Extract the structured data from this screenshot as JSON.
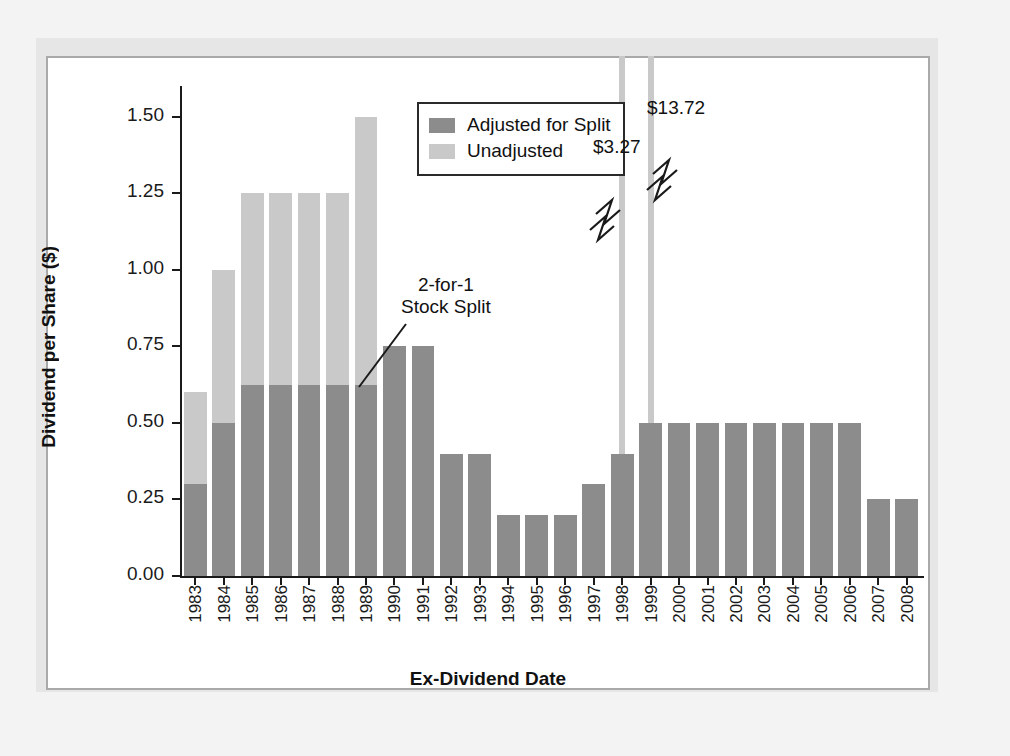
{
  "chart_data": {
    "type": "bar",
    "title": "",
    "xlabel": "Ex-Dividend Date",
    "ylabel": "Dividend per Share ($)",
    "ylim": [
      0.0,
      1.6
    ],
    "ytick_labels": [
      "0.00",
      "0.25",
      "0.50",
      "0.75",
      "1.00",
      "1.25",
      "1.50"
    ],
    "ytick_values": [
      0.0,
      0.25,
      0.5,
      0.75,
      1.0,
      1.25,
      1.5
    ],
    "grid": false,
    "legend_position": "top-center",
    "categories": [
      "1983",
      "1984",
      "1985",
      "1986",
      "1987",
      "1988",
      "1989",
      "1990",
      "1991",
      "1992",
      "1993",
      "1994",
      "1995",
      "1996",
      "1997",
      "1998",
      "1999",
      "2000",
      "2001",
      "2002",
      "2003",
      "2004",
      "2005",
      "2006",
      "2007",
      "2008"
    ],
    "series": [
      {
        "name": "Adjusted for Split",
        "color": "#8c8c8c",
        "values": [
          0.3,
          0.5,
          0.625,
          0.625,
          0.625,
          0.625,
          0.625,
          0.75,
          0.75,
          0.4,
          0.4,
          0.2,
          0.2,
          0.2,
          0.3,
          0.4,
          0.5,
          0.5,
          0.5,
          0.5,
          0.5,
          0.5,
          0.5,
          0.5,
          0.25,
          0.25
        ]
      },
      {
        "name": "Unadjusted",
        "color": "#c9c9c9",
        "values": [
          0.6,
          1.0,
          1.25,
          1.25,
          1.25,
          1.25,
          1.5,
          null,
          null,
          null,
          null,
          null,
          null,
          null,
          null,
          3.27,
          13.72,
          null,
          null,
          null,
          null,
          null,
          null,
          null,
          null,
          null
        ]
      }
    ],
    "annotations": [
      {
        "name": "stock-split",
        "text_lines": [
          "2-for-1",
          "Stock Split"
        ],
        "points_to_category": "1990"
      },
      {
        "name": "break-value-1998",
        "text": "$3.27",
        "category": "1998"
      },
      {
        "name": "break-value-1999",
        "text": "$13.72",
        "category": "1999"
      }
    ]
  },
  "legend": {
    "items": [
      {
        "label": "Adjusted for Split",
        "color": "#8c8c8c"
      },
      {
        "label": "Unadjusted",
        "color": "#c9c9c9"
      }
    ]
  },
  "axes": {
    "y_title": "Dividend per Share ($)",
    "x_title": "Ex-Dividend Date"
  },
  "annotations": {
    "split_line_1": "2-for-1",
    "split_line_2": "Stock Split",
    "break_1998": "$3.27",
    "break_1999": "$13.72"
  }
}
